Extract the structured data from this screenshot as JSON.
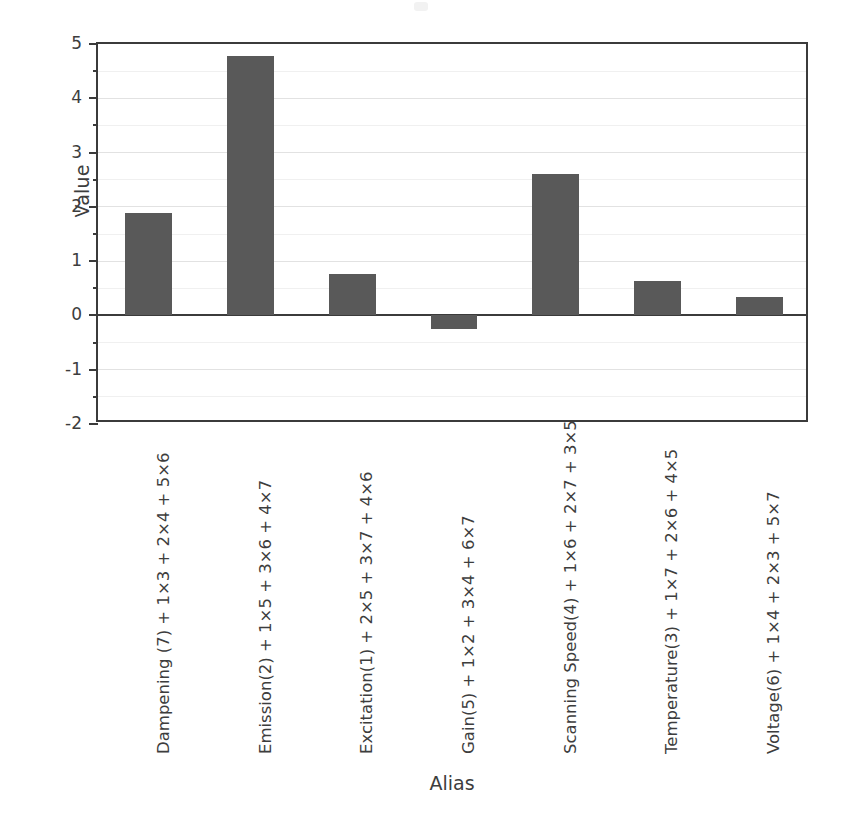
{
  "chart_data": {
    "type": "bar",
    "title": "",
    "xlabel": "Alias",
    "ylabel": "Value",
    "ylim": [
      -2,
      5
    ],
    "ytick_labels": [
      "5",
      "4",
      "3",
      "2",
      "1",
      "0",
      "-1",
      "-2"
    ],
    "ytick_values": [
      5,
      4,
      3,
      2,
      1,
      0,
      -1,
      -2
    ],
    "minor_tick_step": 0.5,
    "grid": true,
    "grid_axis": "y",
    "legend": "none",
    "bar_color": "#595959",
    "axis_color": "#3b3b3b",
    "grid_color": "#e2e2e2",
    "categories": [
      "Dampening (7) + 1×3 + 2×4 + 5×6",
      "Emission(2) + 1×5 + 3×6 + 4×7",
      "Excitation(1) + 2×5 + 3×7 + 4×6",
      "Gain(5) + 1×2 + 3×4 + 6×7",
      "Scanning Speed(4) + 1×6 + 2×7 + 3×5",
      "Temperature(3) + 1×7 + 2×6 + 4×5",
      "Voltage(6) + 1×4 + 2×3 + 5×7"
    ],
    "values": [
      1.89,
      4.77,
      0.77,
      -0.25,
      2.61,
      0.63,
      0.34
    ]
  }
}
